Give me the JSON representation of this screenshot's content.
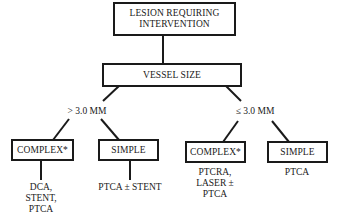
{
  "diagram": {
    "root": {
      "label": "LESION REQUIRING\nINTERVENTION"
    },
    "decision": {
      "label": "VESSEL SIZE"
    },
    "branches": [
      {
        "condition": "> 3.0 MM",
        "children": [
          {
            "label": "COMPLEX*",
            "treatment": "DCA,\nSTENT,\nPTCA"
          },
          {
            "label": "SIMPLE",
            "treatment": "PTCA ± STENT"
          }
        ]
      },
      {
        "condition": "≤ 3.0 MM",
        "children": [
          {
            "label": "COMPLEX*",
            "treatment": "PTCRA,\nLASER ±\nPTCA"
          },
          {
            "label": "SIMPLE",
            "treatment": "PTCA"
          }
        ]
      }
    ]
  },
  "colors": {
    "stroke": "#1a1a1a",
    "background": "#ffffff"
  }
}
